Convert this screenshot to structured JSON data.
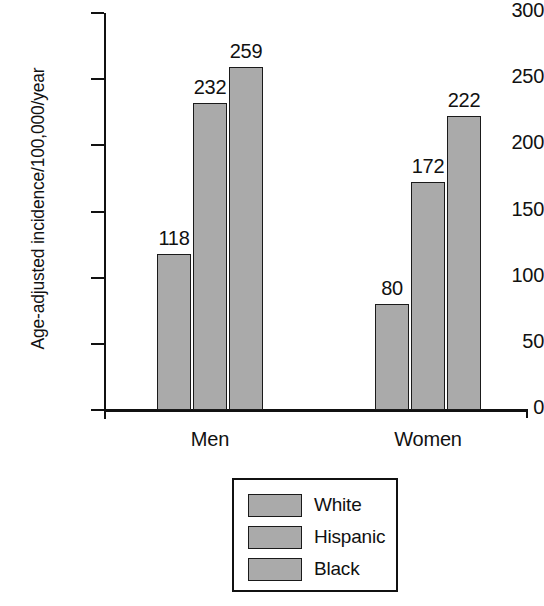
{
  "chart_data": {
    "type": "bar",
    "title": "",
    "xlabel": "",
    "ylabel": "Age-adjusted incidence/100,000/year",
    "categories": [
      "Men",
      "Women"
    ],
    "series": [
      {
        "name": "White",
        "values": [
          118,
          80
        ]
      },
      {
        "name": "Hispanic",
        "values": [
          232,
          172
        ]
      },
      {
        "name": "Black",
        "values": [
          259,
          222
        ]
      }
    ],
    "ylim": [
      0,
      300
    ],
    "yticks": [
      0,
      50,
      100,
      150,
      200,
      250,
      300
    ],
    "ytick_labels": [
      "0",
      "50",
      "100",
      "150",
      "200",
      "250",
      "300"
    ],
    "grid": false,
    "legend_position": "bottom-center",
    "bar_fill_color": "#aaaaaa",
    "bar_edge_color": "#1a1a1a",
    "data_labels": [
      "118",
      "232",
      "259",
      "80",
      "172",
      "222"
    ]
  },
  "axis": {
    "y_title": "Age-adjusted incidence/100,000/year",
    "ticks": [
      {
        "label": "300",
        "value": 300
      },
      {
        "label": "250",
        "value": 250
      },
      {
        "label": "200",
        "value": 200
      },
      {
        "label": "150",
        "value": 150
      },
      {
        "label": "100",
        "value": 100
      },
      {
        "label": "50",
        "value": 50
      },
      {
        "label": "0",
        "value": 0
      }
    ]
  },
  "groups": [
    {
      "label": "Men",
      "bars": [
        {
          "series": "White",
          "value": 118,
          "value_label": "118"
        },
        {
          "series": "Hispanic",
          "value": 232,
          "value_label": "232"
        },
        {
          "series": "Black",
          "value": 259,
          "value_label": "259"
        }
      ]
    },
    {
      "label": "Women",
      "bars": [
        {
          "series": "White",
          "value": 80,
          "value_label": "80"
        },
        {
          "series": "Hispanic",
          "value": 172,
          "value_label": "172"
        },
        {
          "series": "Black",
          "value": 222,
          "value_label": "222"
        }
      ]
    }
  ],
  "legend": {
    "entries": [
      {
        "label": "White",
        "color": "#aaaaaa"
      },
      {
        "label": "Hispanic",
        "color": "#aaaaaa"
      },
      {
        "label": "Black",
        "color": "#aaaaaa"
      }
    ]
  }
}
